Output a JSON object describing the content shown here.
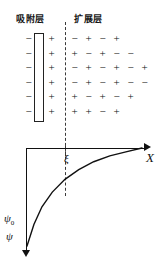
{
  "figure": {
    "headers": {
      "adsorption_layer": "吸附层",
      "diffuse_layer": "扩展层"
    },
    "charge_rows": [
      {
        "inner_negative": "−",
        "inner_positive": "+",
        "outer": [
          "−",
          "+",
          "−",
          "+"
        ]
      },
      {
        "inner_negative": "−",
        "inner_positive": "+",
        "outer": [
          "+",
          "−",
          "+",
          "−",
          "−"
        ]
      },
      {
        "inner_negative": "−",
        "inner_positive": "+",
        "outer": [
          "−",
          "+",
          "−",
          "+",
          "−",
          "+"
        ]
      },
      {
        "inner_negative": "−",
        "inner_positive": "+",
        "outer": [
          "−",
          "+",
          "−",
          "+",
          "−",
          "−"
        ]
      },
      {
        "inner_negative": "−",
        "inner_positive": "+",
        "outer": [
          "+",
          "−",
          "+",
          "−",
          "+"
        ]
      },
      {
        "inner_negative": "−",
        "inner_positive": "+",
        "outer": [
          "+",
          "+",
          "−",
          "+"
        ]
      }
    ],
    "axes": {
      "x_label": "X",
      "y_label": "ψ",
      "y_origin_label": "ψ0",
      "boundary_label": "ξ"
    },
    "colors": {
      "ink": "#111111",
      "bracket": "#222222",
      "dashed": "#3a3a3a",
      "background": "#ffffff"
    }
  },
  "chart_data": {
    "type": "line",
    "xlabel": "X",
    "ylabel": "ψ",
    "grid": false,
    "legend": null,
    "annotations": [
      {
        "text": "ξ",
        "description": "zeta potential / shear plane boundary between adsorption layer and diffuse layer"
      },
      {
        "text": "ψ0",
        "description": "surface potential at X = 0"
      },
      {
        "text": "ψ",
        "description": "potential axis, plotted downward from the X axis"
      }
    ],
    "series": [
      {
        "name": "potential-decay",
        "x": [
          0,
          0.06,
          0.13,
          0.22,
          0.33,
          0.45,
          0.58,
          0.72,
          0.86,
          1.0
        ],
        "y": [
          1.0,
          0.78,
          0.6,
          0.45,
          0.32,
          0.22,
          0.14,
          0.08,
          0.04,
          0.0
        ]
      }
    ],
    "xlim": [
      0,
      1
    ],
    "ylim": [
      0,
      1
    ],
    "note": "Potential axis is inverted (increasing ψ downward); curve decays exponentially from ψ0 at the surface toward zero far from the surface."
  }
}
